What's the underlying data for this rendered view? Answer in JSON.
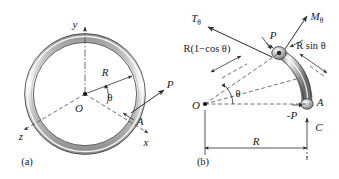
{
  "figure": {
    "panels": [
      {
        "id": "a",
        "caption": "(a)",
        "description": "Complete circular ring in 3D axes x, y, z with point A on ring and applied force P",
        "labels": {
          "axis_y": "y",
          "axis_x": "x",
          "axis_z": "z",
          "origin": "O",
          "radius": "R",
          "angle": "θ",
          "force": "P",
          "point": "A"
        }
      },
      {
        "id": "b",
        "caption": "(b)",
        "description": "Free body diagram of ring segment from section to point A showing torsion, moment, and reactions",
        "labels": {
          "torsion": "T",
          "torsion_sub": "θ",
          "moment": "M",
          "moment_sub": "θ",
          "force_at_cut": "P",
          "force_reverse": "-P",
          "reaction": "C",
          "origin": "O",
          "point": "A",
          "angle": "θ",
          "dim_horizontal": "R",
          "dim_rcos": "R(1−cos θ)",
          "dim_rsin": "R sin θ"
        }
      }
    ]
  },
  "colors": {
    "background": "#ffffff",
    "ink": "#1a1a1a",
    "line": "#2b2b2b",
    "dashed": "#4a4a4a",
    "tube_light": "#f2f2f2",
    "tube_mid": "#b8b8b8",
    "tube_dark": "#6e6e6e",
    "tube_shadow": "#8c8c8c"
  }
}
